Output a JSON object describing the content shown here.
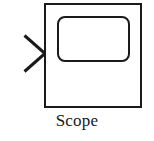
{
  "canvas": {
    "width": 154,
    "height": 141,
    "background_color": "#ffffff"
  },
  "block": {
    "name": "Scope",
    "label": "Scope",
    "kind": "simulink-scope-block",
    "stroke_color": "#1a1a1a",
    "fill_color": "#ffffff",
    "outer_box": {
      "x": 44,
      "y": 3,
      "width": 98,
      "height": 105,
      "stroke_width": 2,
      "corner_radius": 0
    },
    "screen": {
      "shape": "rounded-rectangle",
      "x": 57,
      "y": 16,
      "width": 73,
      "height": 46,
      "corner_radius": 7,
      "stroke_width": 2
    },
    "input_port": {
      "shape": "chevron-arrow",
      "direction": "right",
      "tip_x": 45,
      "tip_y": 53,
      "tail_x": 24,
      "top_y": 35,
      "bottom_y": 72,
      "stroke_width": 3
    }
  },
  "icons": {
    "input_arrow": "input-arrow-icon",
    "scope_screen": "scope-screen-icon"
  }
}
